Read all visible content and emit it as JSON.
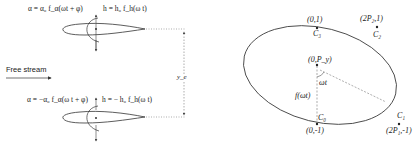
{
  "left_panel": {
    "top_airfoil": {
      "pitch_equation": "α = α₀ f_α(ωt + φ)",
      "heave_equation": "h = h₀ f_h(ω t)"
    },
    "bottom_airfoil": {
      "pitch_equation": "α = −α₀ f_α(ω t + φ)",
      "heave_equation": "h = − h₀ f_h(ω t)"
    },
    "free_stream_label": "Free stream",
    "separation_label": "y_e"
  },
  "right_panel": {
    "points": [
      {
        "name": "C3",
        "label": "C₃",
        "coord": "(0,1)"
      },
      {
        "name": "C2",
        "label": "C₂",
        "coord": "(2P₂,1)"
      },
      {
        "name": "P",
        "label": "",
        "coord": "(0,P_y)"
      },
      {
        "name": "C0",
        "label": "C₀",
        "coord": "(0,-1)"
      },
      {
        "name": "C1",
        "label": "C₁",
        "coord": "(2P₁,-1)"
      }
    ],
    "angle_label": "ωt",
    "radius_label": "f(ωt)"
  },
  "colors": {
    "line": "#333333",
    "dashed": "#777777",
    "background": "#ffffff"
  }
}
